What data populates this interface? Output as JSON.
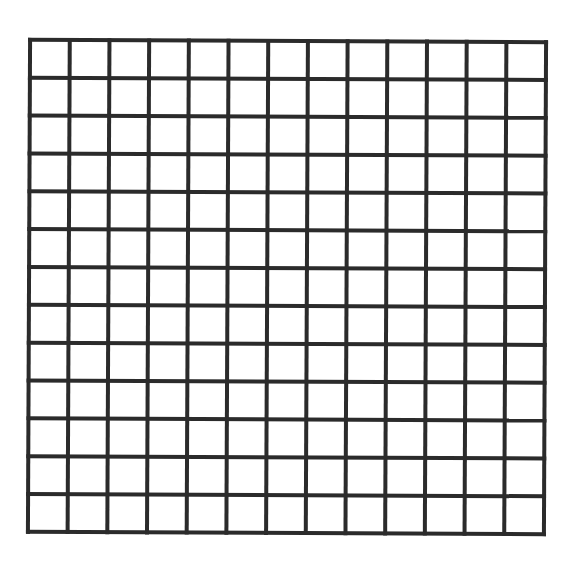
{
  "figure": {
    "type": "square-grid",
    "rows": 13,
    "columns": 13,
    "line_color": "#2b2b2b",
    "background_color": "#ffffff",
    "line_width": 4,
    "bounds": {
      "left": 29,
      "top": 41,
      "right": 545,
      "bottom": 533
    }
  }
}
